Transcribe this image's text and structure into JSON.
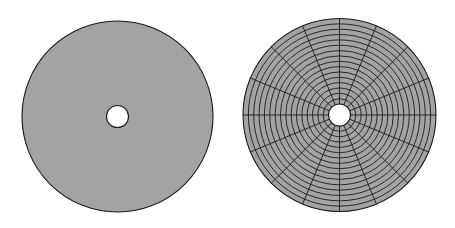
{
  "figure": {
    "width": 455,
    "height": 228,
    "background": "#ffffff",
    "fill_color": "#a3a3a3",
    "stroke_color": "#1a1a1a",
    "hole_color": "#ffffff"
  },
  "disks": [
    {
      "id": "solid-disk",
      "cx": 117.5,
      "cy": 116.5,
      "outer_radius": 95.5,
      "inner_radius": 11,
      "meshed": false
    },
    {
      "id": "meshed-disk",
      "cx": 339.5,
      "cy": 115,
      "outer_radius": 96.5,
      "inner_radius": 11,
      "meshed": true,
      "radial_divisions": 16,
      "angular_divisions": 16
    }
  ]
}
